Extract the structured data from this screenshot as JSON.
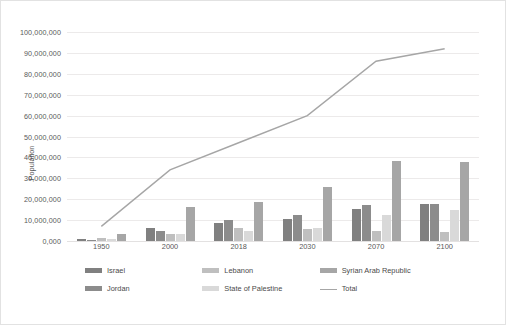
{
  "chart_data": {
    "type": "bar",
    "title": "",
    "xlabel": "",
    "ylabel": "Population",
    "categories": [
      "1950",
      "2000",
      "2018",
      "2030",
      "2070",
      "2100"
    ],
    "ylim": [
      0,
      100000000
    ],
    "ytick_labels": [
      "100,000,000",
      "90,000,000",
      "80,000,000",
      "70,000,000",
      "60,000,000",
      "50,000,000",
      "40,000,000",
      "30,000,000",
      "20,000,000",
      "10,000,000",
      "0,000"
    ],
    "ytick_values": [
      100000000,
      90000000,
      80000000,
      70000000,
      60000000,
      50000000,
      40000000,
      30000000,
      20000000,
      10000000,
      0
    ],
    "grid": true,
    "legend_position": "bottom",
    "series": [
      {
        "name": "Israel",
        "kind": "bar",
        "color": "#808080",
        "values": [
          1200000,
          6000000,
          8800000,
          10500000,
          15500000,
          17500000
        ]
      },
      {
        "name": "Jordan",
        "kind": "bar",
        "color": "#8c8c8c",
        "values": [
          450000,
          5000000,
          10000000,
          12500000,
          17000000,
          17500000
        ]
      },
      {
        "name": "Lebanon",
        "kind": "bar",
        "color": "#bfbfbf",
        "values": [
          1400000,
          3200000,
          6000000,
          5800000,
          4800000,
          4200000
        ]
      },
      {
        "name": "State of Palestine",
        "kind": "bar",
        "color": "#d9d9d9",
        "values": [
          950000,
          3200000,
          4900000,
          6400000,
          12500000,
          15000000
        ]
      },
      {
        "name": "Syrian Arab Republic",
        "kind": "bar",
        "color": "#a6a6a6",
        "values": [
          3500000,
          16400000,
          18500000,
          25800000,
          38200000,
          38000000
        ]
      },
      {
        "name": "Total",
        "kind": "line",
        "color": "#a6a6a6",
        "values": [
          7000000,
          34000000,
          47000000,
          60000000,
          86000000,
          92000000
        ]
      }
    ]
  }
}
